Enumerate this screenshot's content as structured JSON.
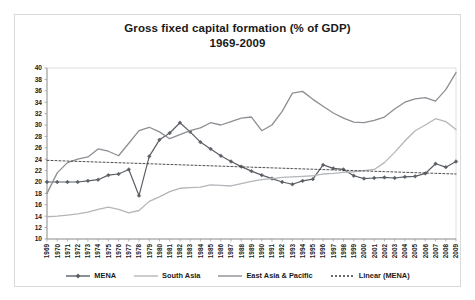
{
  "chart_data": {
    "type": "line",
    "title": "Gross fixed capital formation (% of GDP)",
    "subtitle": "1969-2009",
    "xlabel": "",
    "ylabel": "",
    "ylim": [
      10,
      40
    ],
    "ytick_step": 2,
    "yticks": [
      10,
      12,
      14,
      16,
      18,
      20,
      22,
      24,
      26,
      28,
      30,
      32,
      34,
      36,
      38,
      40
    ],
    "grid": false,
    "legend_position": "bottom",
    "x": [
      1969,
      1970,
      1971,
      1972,
      1973,
      1974,
      1975,
      1976,
      1977,
      1978,
      1979,
      1980,
      1981,
      1982,
      1983,
      1984,
      1985,
      1986,
      1987,
      1988,
      1989,
      1990,
      1991,
      1992,
      1993,
      1994,
      1995,
      1996,
      1997,
      1998,
      1999,
      2000,
      2001,
      2002,
      2003,
      2004,
      2005,
      2006,
      2007,
      2008,
      2009
    ],
    "xtick_labels": [
      "1969",
      "1970",
      "1971",
      "1972",
      "1973",
      "1974",
      "1975",
      "1976",
      "1977",
      "1978",
      "1979",
      "1980",
      "1981",
      "1982",
      "1983",
      "1984",
      "1985",
      "1986",
      "1987",
      "1988",
      "1989",
      "1990",
      "1991",
      "1992",
      "1993",
      "1994",
      "1995",
      "1996",
      "1997",
      "1998",
      "1999",
      "2000",
      "2001",
      "2002",
      "2003",
      "2004",
      "2005",
      "2006",
      "2007",
      "2008",
      "2009"
    ],
    "series": [
      {
        "name": "MENA",
        "color": "#5b5f66",
        "width": 1.2,
        "dash": "none",
        "markers": "diamond",
        "values": [
          20.0,
          20.0,
          20.0,
          20.0,
          20.2,
          20.4,
          21.2,
          21.4,
          22.2,
          17.6,
          24.5,
          27.4,
          28.6,
          30.4,
          28.8,
          27.0,
          25.8,
          24.6,
          23.6,
          22.7,
          21.9,
          21.2,
          20.6,
          20.0,
          19.6,
          20.2,
          20.5,
          23.0,
          22.4,
          22.2,
          21.1,
          20.6,
          20.7,
          20.8,
          20.7,
          20.9,
          21.0,
          21.5,
          23.2,
          22.6,
          23.6
        ]
      },
      {
        "name": "South Asia",
        "color": "#b3b6ba",
        "width": 1.3,
        "dash": "none",
        "markers": "none",
        "values": [
          13.9,
          14.0,
          14.2,
          14.4,
          14.7,
          15.2,
          15.6,
          15.2,
          14.6,
          15.0,
          16.6,
          17.4,
          18.3,
          18.9,
          19.0,
          19.1,
          19.5,
          19.4,
          19.3,
          19.7,
          20.1,
          20.4,
          20.6,
          20.8,
          20.9,
          21.0,
          21.1,
          21.4,
          21.5,
          21.7,
          21.8,
          22.0,
          22.2,
          23.4,
          25.2,
          27.2,
          29.0,
          30.0,
          31.1,
          30.6,
          29.2
        ]
      },
      {
        "name": "East Asia & Pacific",
        "color": "#8b8f94",
        "width": 1.3,
        "dash": "none",
        "markers": "none",
        "values": [
          18.0,
          21.6,
          23.4,
          24.0,
          24.4,
          25.8,
          25.4,
          24.6,
          26.8,
          29.0,
          29.6,
          28.8,
          27.6,
          28.3,
          29.0,
          29.5,
          30.4,
          30.0,
          30.6,
          31.2,
          31.4,
          29.0,
          30.0,
          32.4,
          35.6,
          35.9,
          34.5,
          33.3,
          32.1,
          31.2,
          30.5,
          30.4,
          30.8,
          31.4,
          32.8,
          34.0,
          34.6,
          34.8,
          34.2,
          36.2,
          39.2
        ]
      },
      {
        "name": "Linear (MENA)",
        "color": "#3a3a3a",
        "width": 0.9,
        "dash": "2,2",
        "markers": "none",
        "trend": true,
        "values": [
          23.8,
          23.74,
          23.68,
          23.62,
          23.56,
          23.5,
          23.44,
          23.38,
          23.32,
          23.26,
          23.2,
          23.14,
          23.08,
          23.02,
          22.96,
          22.9,
          22.84,
          22.78,
          22.72,
          22.66,
          22.6,
          22.54,
          22.48,
          22.42,
          22.36,
          22.3,
          22.24,
          22.18,
          22.12,
          22.06,
          22.0,
          21.94,
          21.88,
          21.82,
          21.76,
          21.7,
          21.64,
          21.58,
          21.52,
          21.46,
          21.4
        ]
      }
    ],
    "legend": [
      {
        "label": "MENA",
        "color": "#5b5f66",
        "style": "solid-marker"
      },
      {
        "label": "South Asia",
        "color": "#b3b6ba",
        "style": "solid"
      },
      {
        "label": "East Asia & Pacific",
        "color": "#8b8f94",
        "style": "solid"
      },
      {
        "label": "Linear (MENA)",
        "color": "#3a3a3a",
        "style": "dashed"
      }
    ]
  },
  "colors": {
    "frame_border": "#d9d9d9",
    "axis": "#9a9a9a",
    "text": "#1a1a1a",
    "background": "#ffffff"
  }
}
